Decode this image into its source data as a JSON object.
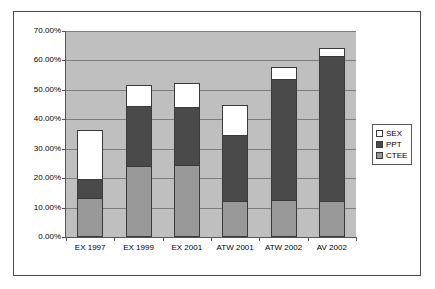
{
  "chart_data": {
    "type": "bar",
    "stacked": true,
    "title": "",
    "xlabel": "",
    "ylabel": "",
    "ylim": [
      0,
      70
    ],
    "ytick_values": [
      0,
      10,
      20,
      30,
      40,
      50,
      60,
      70
    ],
    "ytick_labels": [
      "0.00%",
      "10.00%",
      "20.00%",
      "30.00%",
      "40.00%",
      "50.00%",
      "60.00%",
      "70.00%"
    ],
    "grid": true,
    "legend_position": "right",
    "categories": [
      "EX 1997",
      "EX 1999",
      "EX 2001",
      "ATW 2001",
      "ATW 2002",
      "AV 2002"
    ],
    "series": [
      {
        "name": "CTEE",
        "color": "#999999",
        "values": [
          13.3,
          24.2,
          24.5,
          12.2,
          12.5,
          12.4
        ]
      },
      {
        "name": "PPT",
        "color": "#4a4a4a",
        "values": [
          6.7,
          20.6,
          20.1,
          22.8,
          41.6,
          49.4
        ]
      },
      {
        "name": "SEX",
        "color": "#ffffff",
        "values": [
          17.0,
          7.4,
          8.3,
          10.6,
          4.5,
          3.2
        ]
      }
    ],
    "totals": [
      37.0,
      52.2,
      52.9,
      45.6,
      58.6,
      65.0
    ],
    "colors": {
      "plot_background": "#bfbfbf",
      "chart_background": "#ffffff",
      "gridline": "#7d7d7d",
      "axis": "#555555",
      "bar_outline": "#3a3a3a"
    }
  },
  "legend": {
    "items": [
      {
        "label": "SEX",
        "color": "#ffffff"
      },
      {
        "label": "PPT",
        "color": "#4a4a4a"
      },
      {
        "label": "CTEE",
        "color": "#999999"
      }
    ]
  }
}
